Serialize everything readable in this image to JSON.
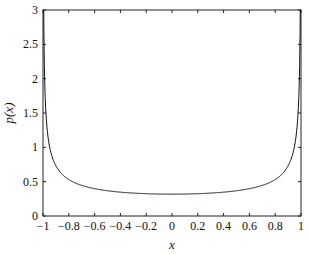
{
  "chart_data": {
    "type": "line",
    "title": "",
    "xlabel": "x",
    "ylabel": "p(x)",
    "xlim": [
      -1,
      1
    ],
    "ylim": [
      0,
      3
    ],
    "grid": false,
    "legend": null,
    "x_ticks": [
      "-1",
      "-0.8",
      "-0.6",
      "-0.4",
      "-0.2",
      "0",
      "0.2",
      "0.4",
      "0.6",
      "0.8",
      "1"
    ],
    "y_ticks": [
      "0",
      "0.5",
      "1",
      "1.5",
      "2",
      "2.5",
      "3"
    ],
    "series": [
      {
        "name": "p(x)",
        "x": [
          -0.999,
          -0.99,
          -0.98,
          -0.95,
          -0.9,
          -0.8,
          -0.7,
          -0.6,
          -0.5,
          -0.4,
          -0.3,
          -0.2,
          -0.1,
          0,
          0.1,
          0.2,
          0.3,
          0.4,
          0.5,
          0.6,
          0.7,
          0.8,
          0.9,
          0.95,
          0.98,
          0.99,
          0.999
        ],
        "values": [
          7.12,
          2.26,
          1.6,
          1.02,
          0.73,
          0.53,
          0.45,
          0.4,
          0.37,
          0.35,
          0.33,
          0.32,
          0.32,
          0.32,
          0.32,
          0.32,
          0.33,
          0.35,
          0.37,
          0.4,
          0.45,
          0.53,
          0.73,
          1.02,
          1.6,
          2.26,
          7.12
        ]
      }
    ]
  }
}
